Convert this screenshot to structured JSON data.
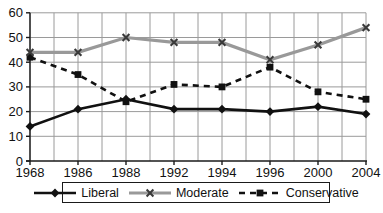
{
  "chart_data": {
    "type": "line",
    "title": "",
    "xlabel": "",
    "ylabel": "",
    "categories": [
      "1968",
      "1986",
      "1988",
      "1992",
      "1994",
      "1996",
      "2000",
      "2004"
    ],
    "x_tick_labels": [
      "1968",
      "1986",
      "1988",
      "1992",
      "1994",
      "1996",
      "2000",
      "2004"
    ],
    "yticks": [
      0,
      10,
      20,
      30,
      40,
      50,
      60
    ],
    "ylim": [
      0,
      60
    ],
    "grid": true,
    "minor_vertical_gridlines": true,
    "legend_position": "bottom",
    "series": [
      {
        "name": "Liberal",
        "values": [
          14,
          21,
          25,
          21,
          21,
          20,
          22,
          19
        ],
        "color": "#111111",
        "style": "solid",
        "marker": "diamond",
        "marker_color": "#111111"
      },
      {
        "name": "Moderate",
        "values": [
          44,
          44,
          50,
          48,
          48,
          41,
          47,
          54
        ],
        "color": "#999999",
        "style": "solid",
        "marker": "x",
        "marker_color": "#3a3a3a"
      },
      {
        "name": "Conservative",
        "values": [
          42,
          35,
          24,
          31,
          30,
          38,
          28,
          25
        ],
        "color": "#111111",
        "style": "dashed",
        "marker": "square",
        "marker_color": "#111111"
      }
    ],
    "colors": {
      "gridline": "#9a9a9a",
      "axis": "#1a1a1a",
      "background": "#ffffff"
    }
  }
}
